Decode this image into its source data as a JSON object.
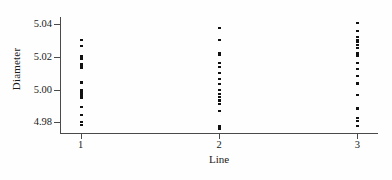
{
  "chart_data": {
    "type": "scatter",
    "title": "",
    "xlabel": "Line",
    "ylabel": "Diameter",
    "xlim": [
      0.85,
      3.15
    ],
    "ylim": [
      4.9735,
      5.0445
    ],
    "grid": false,
    "legend": null,
    "x_ticks": [
      "1",
      "2",
      "3"
    ],
    "x_tick_values": [
      1,
      2,
      3
    ],
    "y_ticks": [
      "5.04",
      "5.02",
      "5.00",
      "4.98"
    ],
    "y_tick_values": [
      5.04,
      5.02,
      5.0,
      4.98
    ],
    "marker_color": "#111111",
    "axis_color": "#4a4a4a",
    "series": [
      {
        "name": "Line 1",
        "x": 1,
        "values": [
          5.0303,
          5.0268,
          5.0205,
          5.0196,
          5.0186,
          5.0158,
          5.0149,
          5.014,
          5.0131,
          5.0048,
          5.0043,
          5.0,
          4.9992,
          4.9983,
          4.9975,
          4.9966,
          4.9957,
          4.9948,
          4.9896,
          4.9844,
          4.9801,
          4.9784
        ]
      },
      {
        "name": "Line 2",
        "x": 2,
        "values": [
          5.0375,
          5.0307,
          5.0222,
          5.0213,
          5.0165,
          5.014,
          5.0102,
          5.0068,
          5.0034,
          5.0,
          4.9975,
          4.9957,
          4.994,
          4.9931,
          4.9914,
          4.9871,
          4.9776,
          4.9767,
          4.9758
        ]
      },
      {
        "name": "Line 3",
        "x": 3,
        "values": [
          5.0409,
          5.0358,
          5.0324,
          5.0307,
          5.029,
          5.0273,
          5.0256,
          5.0222,
          5.0213,
          5.0205,
          5.0162,
          5.0128,
          5.0085,
          5.0043,
          5.0034,
          4.9966,
          4.9888,
          4.9879,
          4.9828,
          4.981,
          4.9776
        ]
      }
    ]
  }
}
